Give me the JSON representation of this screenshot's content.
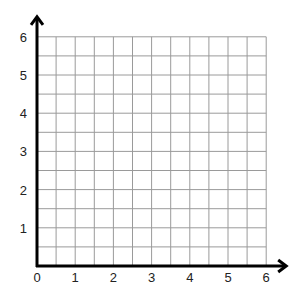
{
  "chart_data": {
    "type": "scatter",
    "title": "",
    "xlabel": "",
    "ylabel": "",
    "xlim": [
      0,
      6
    ],
    "ylim": [
      0,
      6
    ],
    "x_ticks": [
      "0",
      "1",
      "2",
      "3",
      "4",
      "5",
      "6"
    ],
    "y_ticks": [
      "1",
      "2",
      "3",
      "4",
      "5",
      "6"
    ],
    "grid": true,
    "grid_step": 0.5,
    "series": [],
    "colors": {
      "grid": "#9a9a9a",
      "axis": "#000000",
      "background": "#ffffff"
    }
  }
}
